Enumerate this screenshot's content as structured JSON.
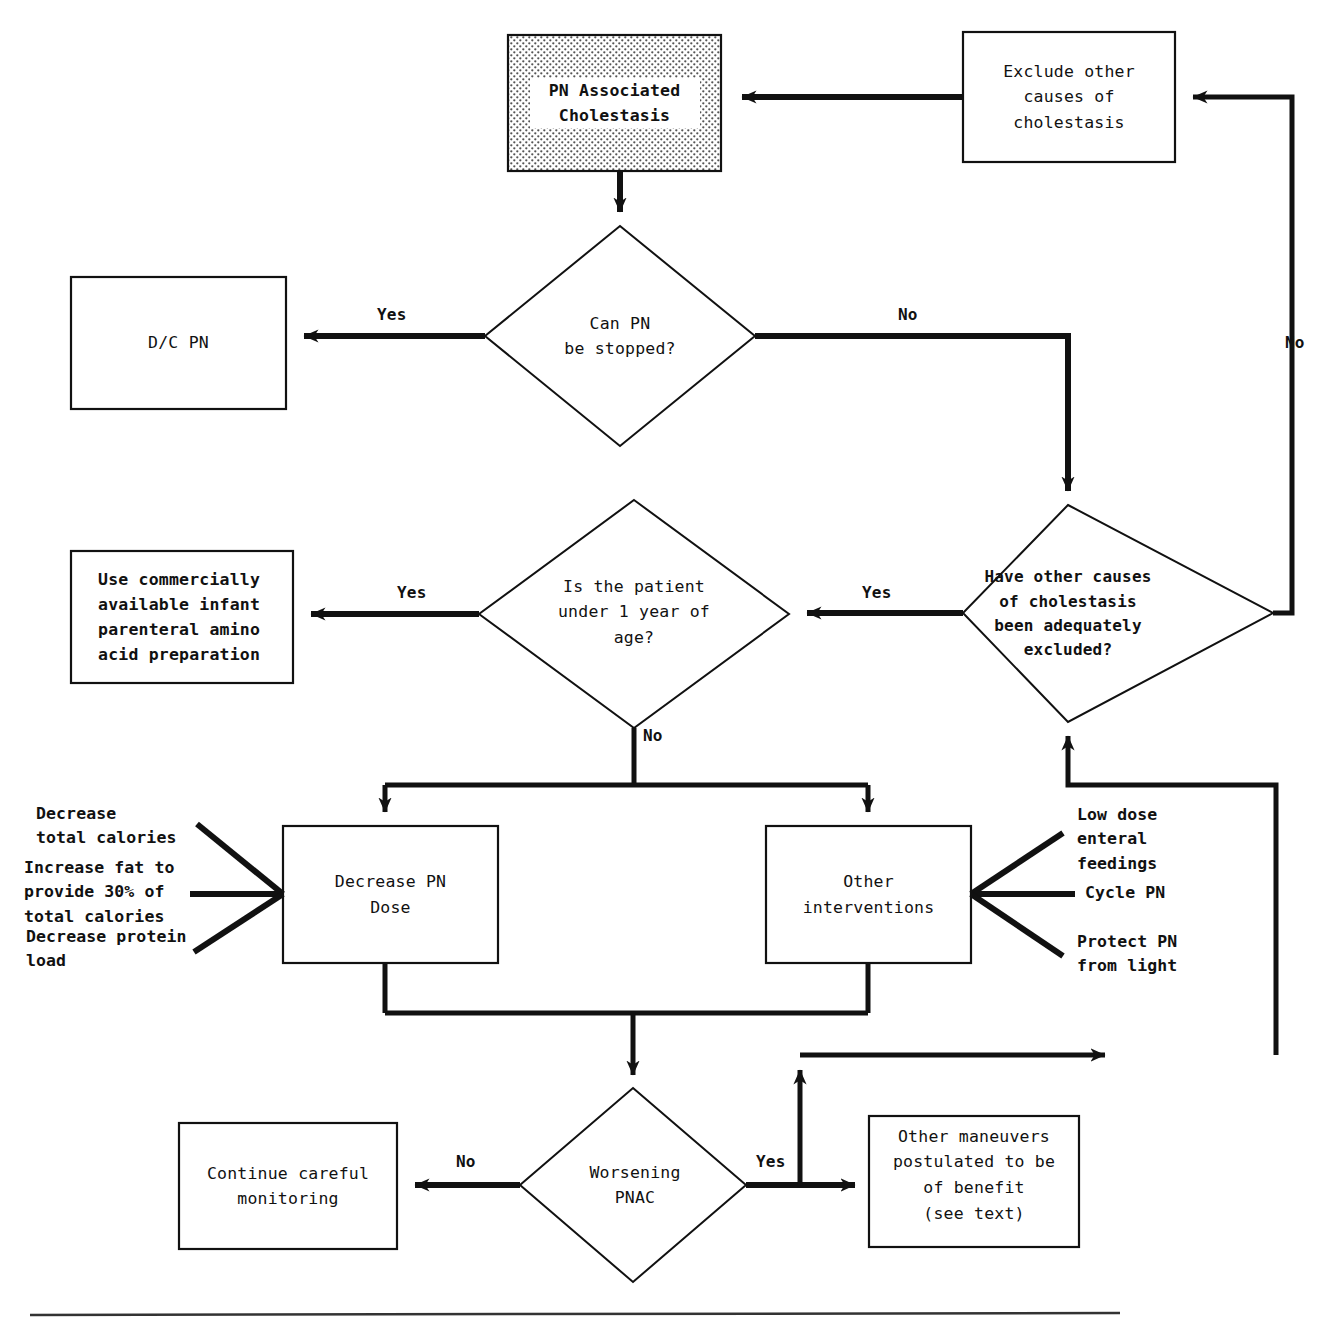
{
  "figure": {
    "type": "flowchart",
    "orientation": "top-down with feedback loops"
  },
  "nodes": {
    "pn_associated_cholestasis": {
      "id": "pn-associated-cholestasis",
      "shape": "rect",
      "fill": "stippled-gray",
      "label": "PN Associated\nCholestasis"
    },
    "exclude_other_causes": {
      "id": "exclude-other-causes",
      "shape": "rect",
      "fill": "white",
      "label": "Exclude other\ncauses of\ncholestasis"
    },
    "can_pn_be_stopped": {
      "id": "can-pn-be-stopped",
      "shape": "diamond",
      "label": "Can PN\nbe stopped?"
    },
    "dc_pn": {
      "id": "dc-pn",
      "shape": "rect",
      "fill": "white",
      "label": "D/C PN"
    },
    "have_other_causes_excluded": {
      "id": "have-other-causes-excluded",
      "shape": "diamond",
      "label": "Have other causes\nof cholestasis\nbeen adequately\nexcluded?"
    },
    "is_patient_under_1": {
      "id": "is-patient-under-1-year",
      "shape": "diamond",
      "label": "Is the patient\nunder 1 year of\nage?"
    },
    "use_infant_amino_acid": {
      "id": "use-infant-amino-acid-preparation",
      "shape": "rect",
      "fill": "white",
      "label": "Use commercially\navailable infant\nparenteral amino\nacid preparation"
    },
    "decrease_pn_dose": {
      "id": "decrease-pn-dose",
      "shape": "rect",
      "fill": "white",
      "label": "Decrease PN\nDose"
    },
    "other_interventions": {
      "id": "other-interventions",
      "shape": "rect",
      "fill": "white",
      "label": "Other\ninterventions"
    },
    "worsening_pnac": {
      "id": "worsening-pnac",
      "shape": "diamond",
      "label": "Worsening\nPNAC"
    },
    "continue_monitoring": {
      "id": "continue-careful-monitoring",
      "shape": "rect",
      "fill": "white",
      "label": "Continue careful\nmonitoring"
    },
    "other_maneuvers": {
      "id": "other-maneuvers",
      "shape": "rect",
      "fill": "white",
      "label": "Other maneuvers\npostulated to be\nof benefit",
      "sublabel": "(see text)"
    }
  },
  "annotations": {
    "decrease_pn_dose_items": [
      "Decrease\ntotal calories",
      "Increase fat to\nprovide 30% of\ntotal calories",
      "Decrease protein\nload"
    ],
    "other_interventions_items": [
      "Low dose\nenteral\nfeedings",
      "Cycle PN",
      "Protect PN\nfrom light"
    ]
  },
  "edge_labels": {
    "can_pn_stopped_yes": "Yes",
    "can_pn_stopped_no": "No",
    "have_other_causes_yes": "Yes",
    "have_other_causes_no": "No",
    "under_1_year_yes": "Yes",
    "under_1_year_no": "No",
    "worsening_pnac_no": "No",
    "worsening_pnac_yes": "Yes"
  },
  "edges": [
    {
      "from": "exclude_other_causes",
      "to": "pn_associated_cholestasis",
      "label": ""
    },
    {
      "from": "pn_associated_cholestasis",
      "to": "can_pn_be_stopped",
      "label": ""
    },
    {
      "from": "can_pn_be_stopped",
      "to": "dc_pn",
      "label": "Yes"
    },
    {
      "from": "can_pn_be_stopped",
      "to": "have_other_causes_excluded",
      "label": "No"
    },
    {
      "from": "have_other_causes_excluded",
      "to": "is_patient_under_1",
      "label": "Yes"
    },
    {
      "from": "have_other_causes_excluded",
      "to": "exclude_other_causes",
      "label": "No"
    },
    {
      "from": "is_patient_under_1",
      "to": "use_infant_amino_acid",
      "label": "Yes"
    },
    {
      "from": "is_patient_under_1",
      "to": "decrease_pn_dose",
      "label": "No"
    },
    {
      "from": "is_patient_under_1",
      "to": "other_interventions",
      "label": "No"
    },
    {
      "from": "decrease_pn_dose",
      "to": "worsening_pnac",
      "label": ""
    },
    {
      "from": "other_interventions",
      "to": "worsening_pnac",
      "label": ""
    },
    {
      "from": "worsening_pnac",
      "to": "continue_monitoring",
      "label": "No"
    },
    {
      "from": "worsening_pnac",
      "to": "other_maneuvers",
      "label": "Yes"
    },
    {
      "from": "worsening_pnac",
      "to": "have_other_causes_excluded",
      "label": "Yes"
    }
  ],
  "colors": {
    "stroke": "#111111",
    "background": "#ffffff",
    "stipple": "#7a7a7a"
  }
}
